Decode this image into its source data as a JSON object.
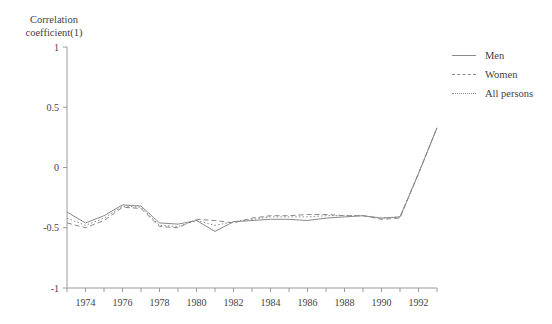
{
  "axis_label": "Correlation\ncoefficient(1)",
  "legend": {
    "position": "right",
    "items": [
      {
        "label": "Men",
        "style": "solid"
      },
      {
        "label": "Women",
        "style": "dashed"
      },
      {
        "label": "All persons",
        "style": "dotted"
      }
    ]
  },
  "chart_data": {
    "type": "line",
    "title": "",
    "xlabel": "",
    "ylabel": "Correlation coefficient(1)",
    "xlim": [
      1973,
      1993
    ],
    "ylim": [
      -1,
      1
    ],
    "grid": false,
    "legend_position": "right",
    "ytick_labels": [
      "1",
      "0.5",
      "0",
      "-0.5",
      "-1"
    ],
    "ytick_values": [
      1,
      0.5,
      0,
      -0.5,
      -1
    ],
    "xtick_labels": [
      "1974",
      "1976",
      "1978",
      "1980",
      "1982",
      "1984",
      "1986",
      "1988",
      "1990",
      "1992"
    ],
    "xtick_values": [
      1974,
      1976,
      1978,
      1980,
      1982,
      1984,
      1986,
      1988,
      1990,
      1992
    ],
    "x": [
      1973,
      1974,
      1975,
      1976,
      1977,
      1978,
      1979,
      1980,
      1981,
      1982,
      1983,
      1984,
      1985,
      1986,
      1987,
      1988,
      1989,
      1990,
      1991,
      1992,
      1993
    ],
    "series": [
      {
        "name": "Men",
        "style": "solid",
        "values": [
          -0.37,
          -0.46,
          -0.4,
          -0.31,
          -0.32,
          -0.46,
          -0.47,
          -0.44,
          -0.53,
          -0.45,
          -0.44,
          -0.43,
          -0.43,
          -0.44,
          -0.42,
          -0.41,
          -0.4,
          -0.42,
          -0.41,
          -0.05,
          0.33
        ]
      },
      {
        "name": "Women",
        "style": "dashed",
        "values": [
          -0.46,
          -0.5,
          -0.44,
          -0.33,
          -0.34,
          -0.49,
          -0.5,
          -0.43,
          -0.44,
          -0.46,
          -0.42,
          -0.4,
          -0.4,
          -0.39,
          -0.39,
          -0.4,
          -0.4,
          -0.43,
          -0.42,
          -0.05,
          0.33
        ]
      },
      {
        "name": "All persons",
        "style": "dotted",
        "values": [
          -0.42,
          -0.48,
          -0.42,
          -0.32,
          -0.33,
          -0.48,
          -0.49,
          -0.44,
          -0.48,
          -0.45,
          -0.43,
          -0.41,
          -0.41,
          -0.41,
          -0.4,
          -0.4,
          -0.4,
          -0.42,
          -0.41,
          -0.05,
          0.33
        ]
      }
    ]
  },
  "colors": {
    "line": "#8a8a8a",
    "axis": "#9a9a9a",
    "text": "#3f3f3f"
  }
}
